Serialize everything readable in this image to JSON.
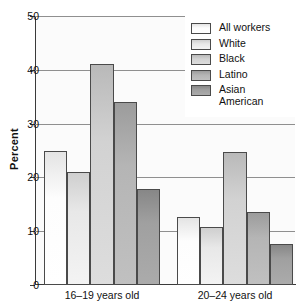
{
  "chart_data": {
    "type": "bar",
    "title": "",
    "xlabel": "",
    "ylabel": "Percent",
    "ylim": [
      0,
      50
    ],
    "yticks": [
      0,
      10,
      20,
      30,
      40,
      50
    ],
    "ytick_labels": [
      "0",
      "10",
      "20",
      "30",
      "40",
      "50"
    ],
    "grid": true,
    "grid_axis": "y",
    "legend_position": "top-right",
    "categories": [
      "16–19 years old",
      "20–24 years old"
    ],
    "series": [
      {
        "name": "All workers",
        "values": [
          25.0,
          12.7
        ],
        "color": "#fdfdfd"
      },
      {
        "name": "White",
        "values": [
          21.0,
          10.7
        ],
        "color": "#e8e8e8"
      },
      {
        "name": "Black",
        "values": [
          41.0,
          24.7
        ],
        "color": "#d2d2d2"
      },
      {
        "name": "Latino",
        "values": [
          34.0,
          13.5
        ],
        "color": "#b5b5b5"
      },
      {
        "name": "Asian American",
        "values": [
          17.8,
          7.6
        ],
        "color": "#a0a0a0"
      }
    ]
  },
  "legend": {
    "items": [
      {
        "label": "All workers"
      },
      {
        "label": "White"
      },
      {
        "label": "Black"
      },
      {
        "label": "Latino"
      },
      {
        "label": "Asian\nAmerican"
      }
    ]
  },
  "axis": {
    "y_title": "Percent",
    "y_tick_labels": [
      "50",
      "40",
      "30",
      "20",
      "10",
      "0"
    ],
    "x_group_labels": [
      "16–19 years old",
      "20–24 years old"
    ]
  }
}
